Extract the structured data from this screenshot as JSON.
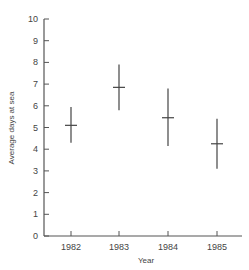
{
  "chart_data": {
    "type": "errorbar",
    "title": "",
    "xlabel": "Year",
    "ylabel": "Average days at sea",
    "categories": [
      "1982",
      "1983",
      "1984",
      "1985"
    ],
    "values": [
      5.1,
      6.85,
      5.45,
      4.25
    ],
    "upper": [
      5.95,
      7.9,
      6.8,
      5.4
    ],
    "lower": [
      4.3,
      5.8,
      4.15,
      3.1
    ],
    "ylim": [
      0,
      10
    ],
    "yticks": [
      0,
      1,
      2,
      3,
      4,
      5,
      6,
      7,
      8,
      9,
      10
    ],
    "grid": false,
    "legend": null
  }
}
